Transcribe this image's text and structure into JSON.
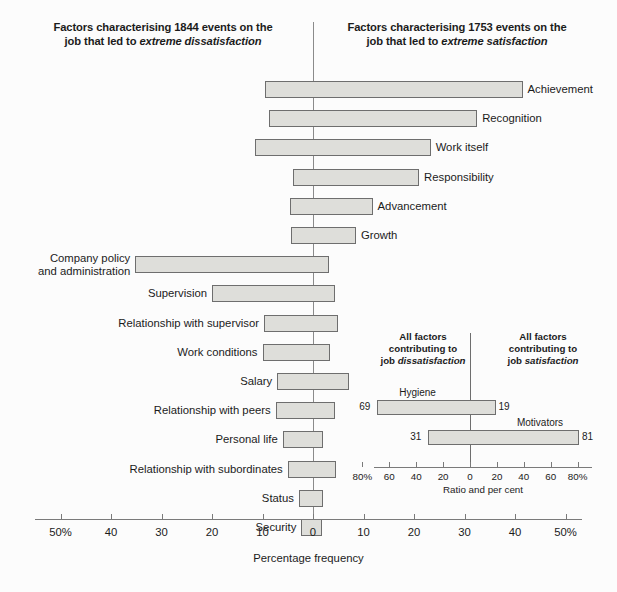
{
  "headers": {
    "left_line1": "Factors characterising 1844 events on the",
    "left_line2_pre": "job that led to ",
    "left_line2_em": "extreme dissatisfaction",
    "right_line1": "Factors characterising 1753 events on the",
    "right_line2_pre": "job that led to ",
    "right_line2_em": "extreme satisfaction"
  },
  "chart_data": {
    "type": "bar",
    "orientation": "horizontal-diverging",
    "xlabel": "Percentage frequency",
    "ylabel": "",
    "xlim": [
      -50,
      50
    ],
    "xticks": [
      -50,
      -40,
      -30,
      -20,
      -10,
      0,
      10,
      20,
      30,
      40,
      50
    ],
    "xticklabels": [
      "50%",
      "40",
      "30",
      "20",
      "10",
      "0",
      "10",
      "20",
      "30",
      "40",
      "50%"
    ],
    "grid": false,
    "legend": "none",
    "series": [
      {
        "name": "dissatisfaction (left of zero)",
        "note": "percentage frequency to the left of the zero line"
      },
      {
        "name": "satisfaction (right of zero)",
        "note": "percentage frequency to the right of the zero line"
      }
    ],
    "categories": [
      "Achievement",
      "Recognition",
      "Work itself",
      "Responsibility",
      "Advancement",
      "Growth",
      "Company policy and administration",
      "Supervision",
      "Relationship with supervisor",
      "Work conditions",
      "Salary",
      "Relationship with peers",
      "Personal life",
      "Relationship with subordinates",
      "Status",
      "Security"
    ],
    "bars": [
      {
        "label": "Achievement",
        "label_line1": "Achievement",
        "label_line2": "",
        "label_side": "right",
        "dissatisfaction": 9.5,
        "satisfaction": 41.5
      },
      {
        "label": "Recognition",
        "label_line1": "Recognition",
        "label_line2": "",
        "label_side": "right",
        "dissatisfaction": 8.8,
        "satisfaction": 32.5
      },
      {
        "label": "Work itself",
        "label_line1": "Work itself",
        "label_line2": "",
        "label_side": "right",
        "dissatisfaction": 11.5,
        "satisfaction": 23.3
      },
      {
        "label": "Responsibility",
        "label_line1": "Responsibility",
        "label_line2": "",
        "label_side": "right",
        "dissatisfaction": 4.0,
        "satisfaction": 21.0
      },
      {
        "label": "Advancement",
        "label_line1": "Advancement",
        "label_line2": "",
        "label_side": "right",
        "dissatisfaction": 4.6,
        "satisfaction": 11.8
      },
      {
        "label": "Growth",
        "label_line1": "Growth",
        "label_line2": "",
        "label_side": "right",
        "dissatisfaction": 4.3,
        "satisfaction": 8.5
      },
      {
        "label": "Company policy and administration",
        "label_line1": "Company policy",
        "label_line2": "and administration",
        "label_side": "left",
        "dissatisfaction": 35.2,
        "satisfaction": 3.2
      },
      {
        "label": "Supervision",
        "label_line1": "Supervision",
        "label_line2": "",
        "label_side": "left",
        "dissatisfaction": 20.0,
        "satisfaction": 4.3
      },
      {
        "label": "Relationship with supervisor",
        "label_line1": "Relationship with supervisor",
        "label_line2": "",
        "label_side": "left",
        "dissatisfaction": 9.7,
        "satisfaction": 4.9
      },
      {
        "label": "Work conditions",
        "label_line1": "Work conditions",
        "label_line2": "",
        "label_side": "left",
        "dissatisfaction": 10.0,
        "satisfaction": 3.4
      },
      {
        "label": "Salary",
        "label_line1": "Salary",
        "label_line2": "",
        "label_side": "left",
        "dissatisfaction": 7.1,
        "satisfaction": 7.2
      },
      {
        "label": "Relationship with peers",
        "label_line1": "Relationship with peers",
        "label_line2": "",
        "label_side": "left",
        "dissatisfaction": 7.4,
        "satisfaction": 4.4
      },
      {
        "label": "Personal life",
        "label_line1": "Personal life",
        "label_line2": "",
        "label_side": "left",
        "dissatisfaction": 6.0,
        "satisfaction": 2.0
      },
      {
        "label": "Relationship with subordinates",
        "label_line1": "Relationship with subordinates",
        "label_line2": "",
        "label_side": "left",
        "dissatisfaction": 5.0,
        "satisfaction": 4.6
      },
      {
        "label": "Status",
        "label_line1": "Status",
        "label_line2": "",
        "label_side": "left",
        "dissatisfaction": 2.8,
        "satisfaction": 2.0
      },
      {
        "label": "Security",
        "label_line1": "Security",
        "label_line2": "",
        "label_side": "left",
        "dissatisfaction": 2.3,
        "satisfaction": 1.7
      }
    ],
    "inset": {
      "type": "bar",
      "orientation": "horizontal-diverging",
      "head_left_line1": "All factors",
      "head_left_line2": "contributing to",
      "head_left_line3_pre": "job ",
      "head_left_line3_em": "dissatisfaction",
      "head_right_line1": "All factors",
      "head_right_line2": "contributing to",
      "head_right_line3_pre": "job ",
      "head_right_line3_em": "satisfaction",
      "xlabel": "Ratio and per cent",
      "xlim": [
        -80,
        80
      ],
      "xticks": [
        -80,
        -60,
        -40,
        -20,
        0,
        20,
        40,
        60,
        80
      ],
      "xticklabels": [
        "80%",
        "60",
        "40",
        "20",
        "0",
        "20",
        "40",
        "60",
        "80%"
      ],
      "bars": [
        {
          "label": "Hygiene",
          "left_value": 69,
          "right_value": 19
        },
        {
          "label": "Motivators",
          "left_value": 31,
          "right_value": 81
        }
      ]
    }
  },
  "colors": {
    "bar_fill": "#dededa",
    "bar_stroke": "#6e6e6e",
    "axis": "#7a7a7a",
    "text": "#1b1b1b",
    "background": "#fcfcfc"
  }
}
